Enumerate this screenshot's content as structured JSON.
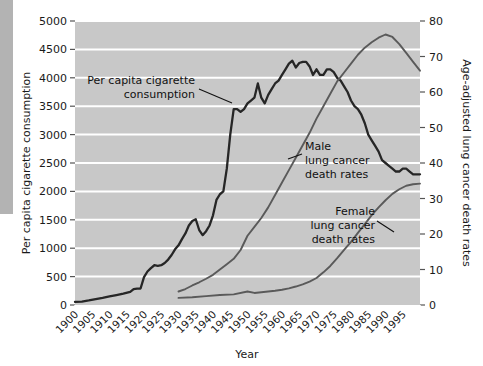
{
  "chart_data": {
    "type": "line",
    "title": "",
    "xlabel": "Year",
    "ylabel": "Per capita cigarette consumption",
    "ylabel_right": "Age-adjusted lung cancer death rates",
    "xlim": [
      1900,
      2000
    ],
    "ylim": [
      0,
      5000
    ],
    "ylim_right": [
      0,
      80
    ],
    "grid": true,
    "gridlines": "horizontal-white",
    "legend_position": "inline-annotations",
    "background": "#c8c8c8",
    "xticks": [
      1900,
      1905,
      1910,
      1915,
      1920,
      1925,
      1930,
      1935,
      1940,
      1945,
      1950,
      1955,
      1960,
      1965,
      1970,
      1975,
      1980,
      1985,
      1990,
      1995
    ],
    "xtick_labels": [
      "1900",
      "1905",
      "1910",
      "1915",
      "1920",
      "1925",
      "1930",
      "1935",
      "1940",
      "1945",
      "1950",
      "1955",
      "1960",
      "1965",
      "1970",
      "1975",
      "1980",
      "1985",
      "1990",
      "1995"
    ],
    "yticks_left": [
      0,
      500,
      1000,
      1500,
      2000,
      2500,
      3000,
      3500,
      4000,
      4500,
      5000
    ],
    "ytick_labels_left": [
      "0",
      "500",
      "1000",
      "1500",
      "2000",
      "2500",
      "3000",
      "3500",
      "4000",
      "4500",
      "5000"
    ],
    "yticks_right": [
      0,
      10,
      20,
      30,
      40,
      50,
      60,
      70,
      80
    ],
    "ytick_labels_right": [
      "0",
      "10",
      "20",
      "30",
      "40",
      "50",
      "60",
      "70",
      "80"
    ],
    "series": [
      {
        "name": "Per capita cigarette consumption",
        "axis": "left",
        "color": "#262626",
        "x": [
          1900,
          1902,
          1904,
          1906,
          1908,
          1910,
          1912,
          1914,
          1916,
          1917,
          1918,
          1919,
          1920,
          1921,
          1922,
          1923,
          1924,
          1925,
          1926,
          1927,
          1928,
          1929,
          1930,
          1931,
          1932,
          1933,
          1934,
          1935,
          1936,
          1937,
          1938,
          1939,
          1940,
          1941,
          1942,
          1943,
          1944,
          1945,
          1946,
          1947,
          1948,
          1949,
          1950,
          1951,
          1952,
          1953,
          1954,
          1955,
          1956,
          1957,
          1958,
          1959,
          1960,
          1961,
          1962,
          1963,
          1964,
          1965,
          1966,
          1967,
          1968,
          1969,
          1970,
          1971,
          1972,
          1973,
          1974,
          1975,
          1976,
          1977,
          1978,
          1979,
          1980,
          1981,
          1982,
          1983,
          1984,
          1985,
          1986,
          1987,
          1988,
          1989,
          1990,
          1991,
          1992,
          1993,
          1994,
          1995,
          1996,
          1997,
          1998,
          1999,
          2000
        ],
        "y": [
          54,
          60,
          80,
          105,
          125,
          150,
          175,
          200,
          230,
          280,
          290,
          290,
          490,
          590,
          650,
          700,
          690,
          700,
          740,
          800,
          880,
          980,
          1050,
          1160,
          1260,
          1400,
          1480,
          1510,
          1320,
          1230,
          1300,
          1400,
          1580,
          1850,
          1950,
          2000,
          2400,
          3000,
          3450,
          3450,
          3400,
          3450,
          3550,
          3600,
          3650,
          3900,
          3650,
          3550,
          3700,
          3800,
          3900,
          3950,
          4050,
          4150,
          4250,
          4300,
          4180,
          4260,
          4280,
          4280,
          4200,
          4050,
          4150,
          4050,
          4050,
          4150,
          4150,
          4100,
          4000,
          3950,
          3850,
          3750,
          3600,
          3500,
          3450,
          3350,
          3200,
          3000,
          2900,
          2800,
          2700,
          2550,
          2500,
          2450,
          2400,
          2350,
          2350,
          2400,
          2400,
          2350,
          2300,
          2300,
          2300
        ]
      },
      {
        "name": "Male lung cancer death rates",
        "axis": "right",
        "color": "#5a5a5a",
        "x": [
          1930,
          1932,
          1934,
          1936,
          1938,
          1940,
          1942,
          1944,
          1946,
          1948,
          1950,
          1952,
          1954,
          1956,
          1958,
          1960,
          1962,
          1964,
          1966,
          1968,
          1970,
          1972,
          1974,
          1976,
          1978,
          1980,
          1982,
          1984,
          1986,
          1988,
          1990,
          1992,
          1994,
          1996,
          1998,
          2000
        ],
        "y": [
          3.8,
          4.5,
          5.5,
          6.4,
          7.4,
          8.5,
          10.0,
          11.5,
          13.0,
          15.5,
          19.5,
          22.0,
          24.5,
          27.5,
          31.0,
          34.5,
          38.0,
          41.5,
          45.0,
          48.5,
          52.5,
          56.0,
          59.5,
          63.0,
          65.5,
          68.0,
          70.5,
          72.5,
          74.0,
          75.3,
          76.2,
          75.5,
          73.5,
          71.0,
          68.5,
          66.0
        ]
      },
      {
        "name": "Female lung cancer death rates",
        "axis": "right",
        "color": "#5a5a5a",
        "x": [
          1930,
          1934,
          1938,
          1942,
          1946,
          1950,
          1952,
          1954,
          1956,
          1958,
          1960,
          1962,
          1964,
          1966,
          1968,
          1970,
          1972,
          1974,
          1976,
          1978,
          1980,
          1982,
          1984,
          1986,
          1988,
          1990,
          1992,
          1994,
          1996,
          1998,
          2000
        ],
        "y": [
          2.0,
          2.2,
          2.5,
          2.8,
          3.0,
          3.8,
          3.4,
          3.6,
          3.8,
          4.0,
          4.3,
          4.7,
          5.2,
          5.8,
          6.6,
          7.6,
          9.2,
          11.0,
          13.2,
          15.5,
          17.8,
          20.3,
          22.8,
          25.3,
          27.5,
          29.5,
          31.3,
          32.6,
          33.6,
          34.0,
          34.2
        ]
      }
    ],
    "annotations": [
      {
        "id": "cigarette-annotation",
        "lines": [
          "Per capita cigarette",
          "consumption"
        ],
        "text": "Per capita cigarette consumption",
        "target_year": 1953,
        "target_value": 3780
      },
      {
        "id": "male-annotation",
        "lines": [
          "Male",
          "lung cancer",
          "death rates"
        ],
        "text": "Male lung cancer death rates",
        "target_year": 1965,
        "target_value": 43
      },
      {
        "id": "female-annotation",
        "lines": [
          "Female",
          "lung cancer",
          "death rates"
        ],
        "text": "Female lung cancer death rates",
        "target_year": 1983,
        "target_value": 21
      }
    ]
  }
}
